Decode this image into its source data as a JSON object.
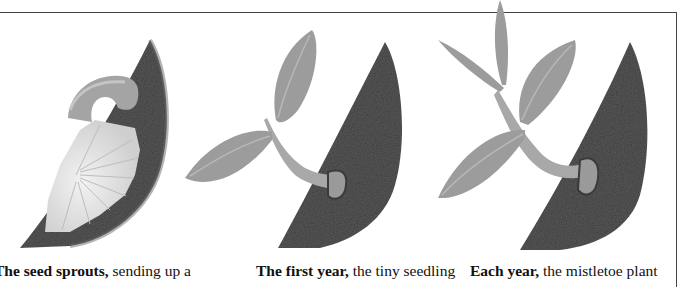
{
  "figure": {
    "panels": [
      {
        "stage": "sprouting",
        "illustration": "mistletoe-seed-sprouting-on-branch",
        "caption_bold": "The seed sprouts,",
        "caption_rest": " sending up a"
      },
      {
        "stage": "first-year",
        "illustration": "mistletoe-seedling-first-year",
        "caption_bold": "The first year,",
        "caption_rest": " the tiny seedling"
      },
      {
        "stage": "each-year",
        "illustration": "mistletoe-plant-growing-yearly",
        "caption_bold": "Each year,",
        "caption_rest": " the mistletoe plant"
      }
    ],
    "colors": {
      "bark": "#565656",
      "bark_dark": "#3c3c3c",
      "leaf": "#9c9c9c",
      "leaf_vein": "#b8b8b8",
      "stem": "#a8a8a8",
      "seed_white": "#e8e8e8",
      "border": "#444444"
    }
  }
}
